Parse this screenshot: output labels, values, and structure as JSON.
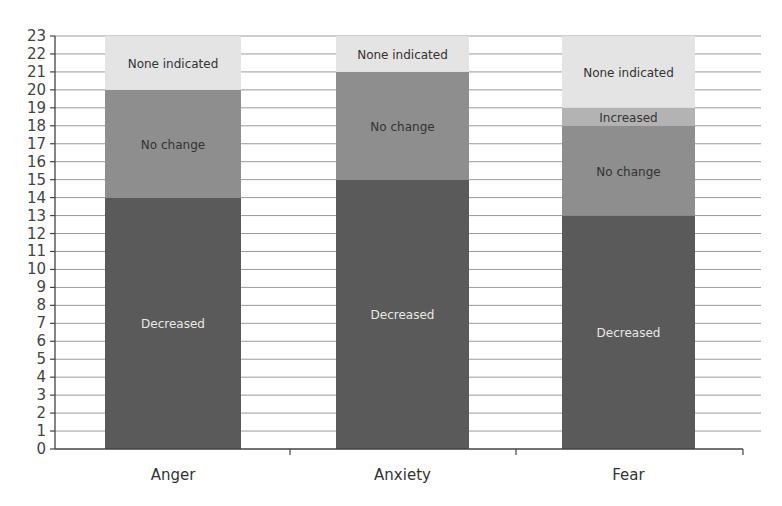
{
  "chart_data": {
    "type": "bar",
    "stacked": true,
    "title": "",
    "xlabel": "",
    "ylabel": "",
    "ylim": [
      0,
      23
    ],
    "yticks": [
      0,
      1,
      2,
      3,
      4,
      5,
      6,
      7,
      8,
      9,
      10,
      11,
      12,
      13,
      14,
      15,
      16,
      17,
      18,
      19,
      20,
      21,
      22,
      23
    ],
    "grid": true,
    "legend": "inline segment labels",
    "categories": [
      "Anger",
      "Anxiety",
      "Fear"
    ],
    "series": [
      {
        "name": "Decreased",
        "values": [
          14,
          15,
          13
        ],
        "color": "#5a5a5a",
        "label_color": "#e8e8e8"
      },
      {
        "name": "No change",
        "values": [
          6,
          6,
          5
        ],
        "color": "#8e8e8e",
        "label_color": "#333333"
      },
      {
        "name": "Increased",
        "values": [
          0,
          0,
          1
        ],
        "color": "#b3b3b3",
        "label_color": "#333333"
      },
      {
        "name": "None indicated",
        "values": [
          3,
          2,
          4
        ],
        "color": "#e4e4e4",
        "label_color": "#333333"
      }
    ]
  }
}
